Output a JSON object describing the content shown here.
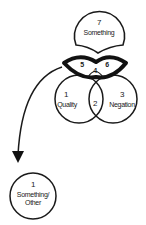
{
  "diagram": {
    "colors": {
      "stroke": "#1a1a1a",
      "background": "#ffffff"
    },
    "nodes": {
      "top": {
        "number": "7",
        "label": "Something"
      },
      "lens": {
        "left": "5",
        "center": "4",
        "right": "6"
      },
      "quality": {
        "number": "1",
        "label": "Quality"
      },
      "overlap": {
        "number": "2"
      },
      "negation": {
        "number": "3",
        "label": "Negation"
      },
      "bottom": {
        "number": "1",
        "label_line1": "Something/",
        "label_line2": "Other"
      }
    },
    "edges": [
      {
        "from": "lens",
        "to": "bottom",
        "style": "curved-arrow"
      }
    ]
  }
}
